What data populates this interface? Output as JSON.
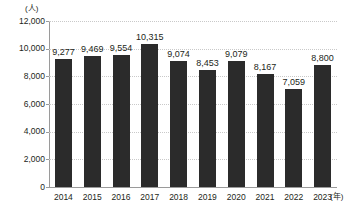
{
  "chart_data": {
    "type": "bar",
    "title": "",
    "subtitle": "",
    "xlabel": "(年)",
    "ylabel": "(人)",
    "categories": [
      "2014",
      "2015",
      "2016",
      "2017",
      "2018",
      "2019",
      "2020",
      "2021",
      "2022",
      "2023"
    ],
    "values": [
      9277,
      9469,
      9554,
      10315,
      9074,
      8453,
      9079,
      8167,
      7059,
      8800
    ],
    "value_labels": [
      "9,277",
      "9,469",
      "9,554",
      "10,315",
      "9,074",
      "8,453",
      "9,079",
      "8,167",
      "7,059",
      "8,800"
    ],
    "ylim": [
      0,
      12000
    ],
    "ytick_values": [
      0,
      2000,
      4000,
      6000,
      8000,
      10000,
      12000
    ],
    "ytick_labels": [
      "0",
      "2,000",
      "4,000",
      "6,000",
      "8,000",
      "10,000",
      "12,000"
    ],
    "grid": true,
    "grid_axis": "y",
    "legend": false,
    "legend_position": "none",
    "bar_color": "#2b2b2b",
    "gridline_color": "#c9c9c9",
    "axis_color": "#9a9a9a",
    "text_color": "#231f20",
    "background_color": "#ffffff",
    "series": [
      {
        "name": "",
        "values": [
          9277,
          9469,
          9554,
          10315,
          9074,
          8453,
          9079,
          8167,
          7059,
          8800
        ]
      }
    ]
  },
  "axes": {
    "y_unit_label": "(人)",
    "x_unit_label": "(年)"
  }
}
